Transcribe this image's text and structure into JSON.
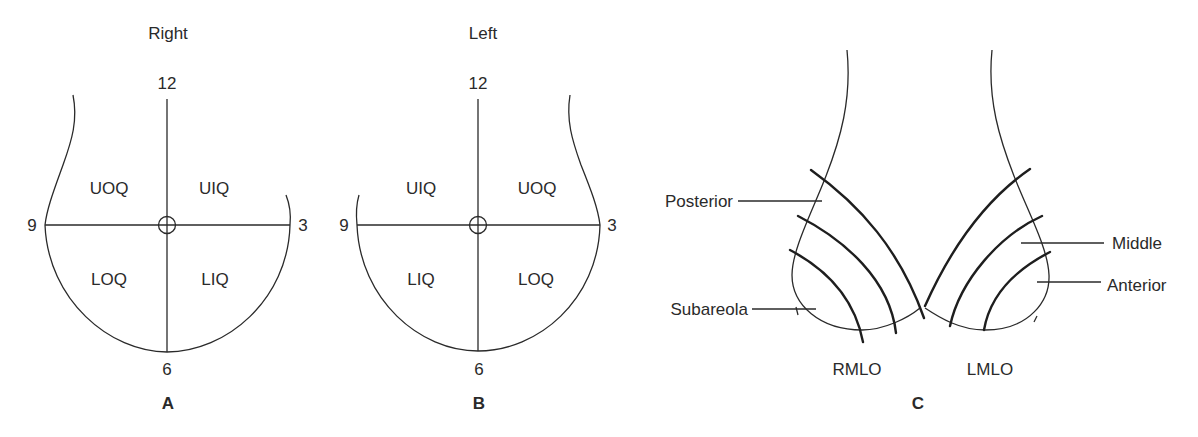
{
  "figure": {
    "panels": [
      {
        "id": "A",
        "letter": "A",
        "title": "Right",
        "clock": {
          "top": "12",
          "right": "3",
          "bottom": "6",
          "left": "9"
        },
        "quadrants": {
          "upper_left": "UOQ",
          "upper_right": "UIQ",
          "lower_left": "LOQ",
          "lower_right": "LIQ"
        }
      },
      {
        "id": "B",
        "letter": "B",
        "title": "Left",
        "clock": {
          "top": "12",
          "right": "3",
          "bottom": "6",
          "left": "9"
        },
        "quadrants": {
          "upper_left": "UIQ",
          "upper_right": "UOQ",
          "lower_left": "LIQ",
          "lower_right": "LOQ"
        }
      },
      {
        "id": "C",
        "letter": "C",
        "views": {
          "right": "RMLO",
          "left": "LMLO"
        },
        "depth_labels": {
          "posterior": "Posterior",
          "subareola": "Subareola",
          "middle": "Middle",
          "anterior": "Anterior"
        }
      }
    ],
    "colors": {
      "line": "#2a2a2a",
      "background": "#ffffff"
    }
  }
}
